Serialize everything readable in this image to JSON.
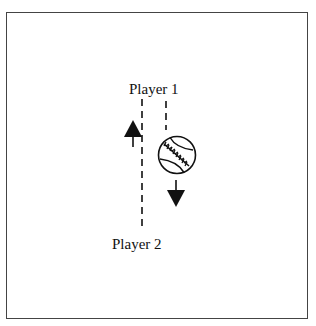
{
  "diagram": {
    "labels": {
      "player1": "Player 1",
      "player2": "Player 2"
    },
    "elements": [
      {
        "type": "dashed-line",
        "name": "player1-player2-path",
        "from": [
          142,
          98
        ],
        "to": [
          142,
          228
        ]
      },
      {
        "type": "dashed-line",
        "name": "ball-path",
        "from": [
          166,
          100
        ],
        "to": [
          166,
          130
        ]
      },
      {
        "type": "arrow",
        "name": "up-arrow",
        "direction": "up"
      },
      {
        "type": "arrow",
        "name": "down-arrow",
        "direction": "down"
      },
      {
        "type": "icon",
        "name": "baseball-icon"
      }
    ],
    "colors": {
      "stroke": "#111111",
      "border": "#444444",
      "background": "#ffffff"
    }
  }
}
